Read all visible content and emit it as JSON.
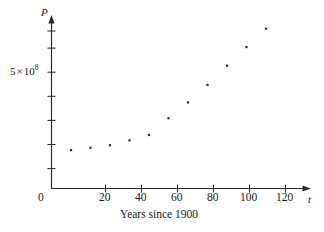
{
  "figure": {
    "background_color": "#ffffff",
    "ink_color": "#2b2b2b"
  },
  "chart_data": {
    "type": "scatter",
    "title": "",
    "subtitle": "",
    "xlabel": "Years since 1900",
    "ylabel": "P",
    "x_axis_variable": "t",
    "y_axis_variable": "P",
    "x": [
      10,
      20,
      30,
      40,
      50,
      60,
      70,
      80,
      90,
      100,
      110
    ],
    "values": [
      1650000000,
      1750000000,
      1860000000,
      2070000000,
      2300000000,
      3020000000,
      3700000000,
      4450000000,
      5280000000,
      6080000000,
      6870000000
    ],
    "series": [
      {
        "name": "World population",
        "values": [
          1650000000,
          1750000000,
          1860000000,
          2070000000,
          2300000000,
          3020000000,
          3700000000,
          4450000000,
          5280000000,
          6080000000,
          6870000000
        ]
      }
    ],
    "points": [
      {
        "x": 10,
        "y": 1650000000
      },
      {
        "x": 20,
        "y": 1750000000
      },
      {
        "x": 30,
        "y": 1860000000
      },
      {
        "x": 40,
        "y": 2070000000
      },
      {
        "x": 50,
        "y": 2300000000
      },
      {
        "x": 60,
        "y": 3020000000
      },
      {
        "x": 70,
        "y": 3700000000
      },
      {
        "x": 80,
        "y": 4450000000
      },
      {
        "x": 90,
        "y": 5280000000
      },
      {
        "x": 100,
        "y": 6080000000
      },
      {
        "x": 110,
        "y": 6870000000
      }
    ],
    "xlim": [
      0,
      130
    ],
    "ylim": [
      0,
      8000000000
    ],
    "xticks": [
      0,
      20,
      40,
      60,
      80,
      100,
      120
    ],
    "xtick_labels": [
      "0",
      "20",
      "40",
      "60",
      "80",
      "100",
      "120"
    ],
    "yticks": [
      1000000000,
      2000000000,
      3000000000,
      4000000000,
      5000000000,
      6000000000,
      7000000000,
      8000000000
    ],
    "ytick_labels": [
      "",
      "",
      "",
      "",
      "5 × 10⁸",
      "",
      "",
      ""
    ],
    "y_labeled_tick_value": 5000000000,
    "grid": false,
    "legend": false,
    "legend_position": "none",
    "marker": "square-dot",
    "marker_color": "#2e2e2e"
  },
  "axes": {
    "y_axis_label": {
      "mantissa": "5",
      "times": "×",
      "base": "10",
      "exponent": "8"
    },
    "y_axis_variable_label": "P",
    "x_axis_variable_label": "t",
    "x_tick_labels": [
      "0",
      "20",
      "40",
      "60",
      "80",
      "100",
      "120"
    ],
    "x_axis_caption": "Years since 1900",
    "origin_label": "0"
  }
}
